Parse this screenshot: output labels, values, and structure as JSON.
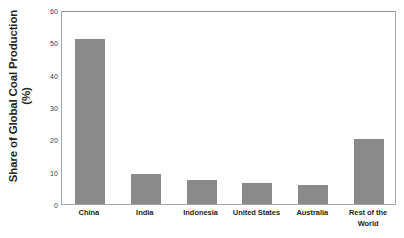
{
  "chart_data": {
    "type": "bar",
    "title": "",
    "subtitle": "",
    "xlabel": "",
    "ylabel": "Share of Global Coal Production (%)",
    "ylabel_lines": [
      "Share of Global Coal Production",
      "(%)"
    ],
    "categories": [
      "China",
      "India",
      "Indonesia",
      "United States",
      "Australia",
      "Rest of the World"
    ],
    "category_label_lines": [
      [
        "China"
      ],
      [
        "India"
      ],
      [
        "Indonesia"
      ],
      [
        "United States"
      ],
      [
        "Australia"
      ],
      [
        "Rest of the",
        "World"
      ]
    ],
    "values": [
      51,
      9.3,
      7.4,
      6.4,
      5.8,
      20
    ],
    "ylim": [
      0,
      60
    ],
    "yticks": [
      0,
      10,
      20,
      30,
      40,
      50,
      60
    ],
    "ytick_labels": [
      "0",
      "10",
      "20",
      "30",
      "40",
      "50",
      "60"
    ],
    "grid": false,
    "legend": null,
    "legend_position": "none",
    "bar_color": "#8a8a8a",
    "frame_color": "#a6a6a6",
    "background_color": "#ffffff",
    "units": "%"
  }
}
